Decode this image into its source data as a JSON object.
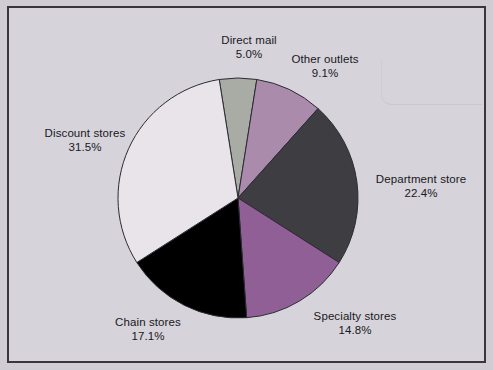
{
  "figure": {
    "background_color": "#d6d3da",
    "frame_color": "#3b3340",
    "outer_color": "#cfccd4"
  },
  "chart_data": {
    "type": "pie",
    "title": "",
    "subtitle": "",
    "xlabel": "",
    "ylabel": "",
    "legend_position": "none",
    "grid": false,
    "labels_outside": true,
    "start_angle_deg": -9,
    "direction": "clockwise",
    "center": {
      "x": 238,
      "y": 198
    },
    "radius": 120,
    "categories": [
      "Direct mail",
      "Other outlets",
      "Department store",
      "Specialty stores",
      "Chain stores",
      "Discount stores"
    ],
    "values": [
      5.0,
      9.1,
      22.4,
      14.8,
      17.1,
      31.5
    ],
    "value_labels": [
      "5.0%",
      "9.1%",
      "22.4%",
      "14.8%",
      "17.1%",
      "31.5%"
    ],
    "colors": [
      "#a8aca4",
      "#ab8bab",
      "#3d3d42",
      "#8f5f96",
      "#000000",
      "#e8e4ea"
    ],
    "slice_edge_color": "#2b2b33",
    "slices": [
      {
        "name": "Direct mail",
        "value": 5.0,
        "value_label": "5.0%",
        "color": "#a8aca4",
        "label_x": 249,
        "label_y": 33
      },
      {
        "name": "Other outlets",
        "value": 9.1,
        "value_label": "9.1%",
        "color": "#ab8bab",
        "label_x": 325,
        "label_y": 52
      },
      {
        "name": "Department store",
        "value": 22.4,
        "value_label": "22.4%",
        "color": "#3d3d42",
        "label_x": 421,
        "label_y": 172
      },
      {
        "name": "Specialty stores",
        "value": 14.8,
        "value_label": "14.8%",
        "color": "#8f5f96",
        "label_x": 355,
        "label_y": 309
      },
      {
        "name": "Chain stores",
        "value": 17.1,
        "value_label": "17.1%",
        "color": "#000000",
        "label_x": 148,
        "label_y": 315
      },
      {
        "name": "Discount stores",
        "value": 31.5,
        "value_label": "31.5%",
        "color": "#e8e4ea",
        "label_x": 85,
        "label_y": 126
      }
    ]
  }
}
